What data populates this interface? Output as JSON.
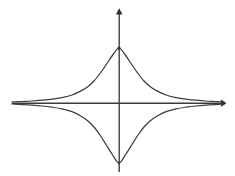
{
  "figure": {
    "kind": "line-plot",
    "background_color": "#ffffff",
    "line_color": "#3d3d3d",
    "axis_color": "#3a3a3a",
    "width": 235,
    "height": 176
  },
  "axes": {
    "origin": {
      "x": 119,
      "y": 103
    },
    "x_axis": {
      "name": "horizontal-axis",
      "x_start": 12,
      "x_end": 224,
      "y": 103,
      "arrow_at": "right"
    },
    "y_axis": {
      "name": "vertical-axis",
      "y_start": 9,
      "y_end": 172,
      "x": 119,
      "arrow_at": "top"
    }
  },
  "chart_data": {
    "type": "line",
    "title": "",
    "subtitle": "",
    "xlabel": "",
    "ylabel": "",
    "grid": false,
    "legend": null,
    "annotations": [],
    "xlim": [
      -107,
      105
    ],
    "ylim": [
      -69,
      94
    ],
    "tick_labels": {
      "x": [],
      "y": []
    },
    "cusps": [
      {
        "name": "upper-cusp",
        "x": 0,
        "y": 55
      },
      {
        "name": "lower-cusp",
        "x": 0,
        "y": -60
      }
    ],
    "series": [
      {
        "name": "upper-branch",
        "x": [
          -107,
          -97,
          -87,
          -77,
          -67,
          -57,
          -47,
          -37,
          -31,
          -25,
          -19,
          -13,
          -7,
          0,
          7,
          13,
          19,
          25,
          31,
          37,
          47,
          57,
          67,
          77,
          87,
          97,
          105
        ],
        "y": [
          1,
          1.5,
          2,
          2.8,
          3.8,
          5.4,
          8,
          12.6,
          16.5,
          22,
          29.5,
          38,
          47,
          55,
          47,
          38,
          29.5,
          22,
          16.5,
          12.6,
          8,
          5.4,
          3.8,
          2.8,
          2,
          1.5,
          1
        ]
      },
      {
        "name": "lower-branch",
        "x": [
          -107,
          -97,
          -87,
          -77,
          -67,
          -57,
          -47,
          -37,
          -31,
          -25,
          -19,
          -13,
          -7,
          0,
          7,
          13,
          19,
          25,
          31,
          37,
          47,
          57,
          67,
          77,
          87,
          97,
          105
        ],
        "y": [
          -1,
          -1.6,
          -2.2,
          -3,
          -4.2,
          -5.9,
          -8.7,
          -13.7,
          -18,
          -24,
          -32,
          -41.5,
          -51,
          -60,
          -51,
          -41.5,
          -32,
          -24,
          -18,
          -13.7,
          -8.7,
          -5.9,
          -4.2,
          -3,
          -2.2,
          -1.6,
          -1
        ]
      }
    ]
  }
}
